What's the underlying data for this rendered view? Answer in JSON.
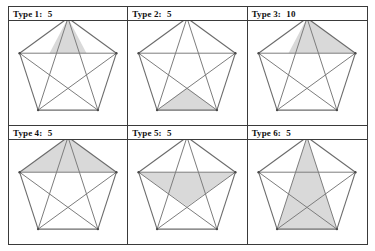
{
  "figure": {
    "kind": "pentagon-triangle-types-table",
    "rows": 2,
    "columns": 3,
    "shade_color": "#d9d9d9",
    "line_color": "#6f6f6f",
    "border_color": "#3a3a3a",
    "cells": [
      {
        "id": "type-1",
        "label_prefix": "Type 1:",
        "count": "5",
        "shaded_vertices": [
          "apex",
          "inner_upper_left",
          "inner_upper_right"
        ],
        "description": "narrow spike triangle at apex bounded by the horizontal diagonal"
      },
      {
        "id": "type-2",
        "label_prefix": "Type 2:",
        "count": "5",
        "shaded_vertices": [
          "bottom_left",
          "bottom_right",
          "inner_bottom"
        ],
        "description": "triangle on the bottom edge rising to the lower star intersection"
      },
      {
        "id": "type-3",
        "label_prefix": "Type 3:",
        "count": "10",
        "shaded_vertices": [
          "apex",
          "inner_upper_left",
          "upper_right"
        ],
        "description": "scalene triangle from apex to the right end of the horizontal diagonal"
      },
      {
        "id": "type-4",
        "label_prefix": "Type 4:",
        "count": "5",
        "shaded_vertices": [
          "apex",
          "upper_left",
          "upper_right"
        ],
        "description": "wide triangle capping the pentagon above the horizontal diagonal"
      },
      {
        "id": "type-5",
        "label_prefix": "Type 5:",
        "count": "5",
        "shaded_vertices": [
          "upper_left",
          "upper_right",
          "inner_bottom"
        ],
        "description": "inverted triangle under the horizontal diagonal"
      },
      {
        "id": "type-6",
        "label_prefix": "Type 6:",
        "count": "5",
        "shaded_vertices": [
          "apex",
          "bottom_left",
          "bottom_right"
        ],
        "description": "tall triangle from apex down to both bottom vertices"
      }
    ],
    "pentagon": {
      "vertices": {
        "apex": [
          53,
          2
        ],
        "upper_right": [
          101.4,
          37.2
        ],
        "bottom_right": [
          82.9,
          94.1
        ],
        "bottom_left": [
          23.1,
          94.1
        ],
        "upper_left": [
          4.6,
          37.2
        ]
      },
      "inner_vertices": {
        "inner_upper_right": [
          71.5,
          37.2
        ],
        "inner_upper_left": [
          34.5,
          37.2
        ],
        "inner_right": [
          82.8,
          58.5
        ],
        "inner_left": [
          23.2,
          58.5
        ],
        "inner_bottom": [
          53,
          71.6
        ]
      },
      "edges": [
        [
          "apex",
          "upper_right"
        ],
        [
          "upper_right",
          "bottom_right"
        ],
        [
          "bottom_right",
          "bottom_left"
        ],
        [
          "bottom_left",
          "upper_left"
        ],
        [
          "upper_left",
          "apex"
        ]
      ],
      "diagonals": [
        [
          "apex",
          "bottom_right"
        ],
        [
          "apex",
          "bottom_left"
        ],
        [
          "upper_left",
          "upper_right"
        ],
        [
          "upper_left",
          "bottom_right"
        ],
        [
          "upper_right",
          "bottom_left"
        ]
      ]
    }
  }
}
